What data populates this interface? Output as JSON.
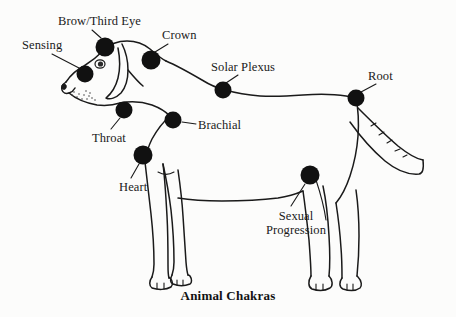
{
  "figure": {
    "title": "Animal Chakras",
    "background_color": "#fcfcfb",
    "ink_color": "#1a1a1a",
    "dot_color": "#111111",
    "width": 456,
    "height": 317
  },
  "chakras": [
    {
      "id": "brow-third-eye",
      "label": "Brow/Third Eye",
      "dot": {
        "cx": 105,
        "cy": 47,
        "r": 9.5
      },
      "label_pos": {
        "x": 58,
        "y": 14
      },
      "leader": {
        "x1": 101,
        "y1": 37,
        "x2": 92,
        "y2": 30
      }
    },
    {
      "id": "sensing",
      "label": "Sensing",
      "dot": {
        "cx": 85,
        "cy": 74,
        "r": 8.5
      },
      "label_pos": {
        "x": 22,
        "y": 38
      },
      "leader": {
        "x1": 78,
        "y1": 68,
        "x2": 50,
        "y2": 53
      }
    },
    {
      "id": "crown",
      "label": "Crown",
      "dot": {
        "cx": 151,
        "cy": 60,
        "r": 9.5
      },
      "label_pos": {
        "x": 162,
        "y": 28
      },
      "leader": {
        "x1": 155,
        "y1": 51,
        "x2": 168,
        "y2": 43
      }
    },
    {
      "id": "solar-plexus",
      "label": "Solar Plexus",
      "dot": {
        "cx": 223,
        "cy": 90,
        "r": 8.5
      },
      "label_pos": {
        "x": 211,
        "y": 60
      },
      "leader": {
        "x1": 226,
        "y1": 82,
        "x2": 237,
        "y2": 74
      }
    },
    {
      "id": "root",
      "label": "Root",
      "dot": {
        "cx": 356,
        "cy": 98,
        "r": 8.5
      },
      "label_pos": {
        "x": 368,
        "y": 69
      },
      "leader": {
        "x1": 361,
        "y1": 91,
        "x2": 376,
        "y2": 83
      }
    },
    {
      "id": "throat",
      "label": "Throat",
      "dot": {
        "cx": 124,
        "cy": 110,
        "r": 8.5
      },
      "label_pos": {
        "x": 92,
        "y": 131
      },
      "leader": {
        "x1": 120,
        "y1": 118,
        "x2": 111,
        "y2": 128
      }
    },
    {
      "id": "brachial",
      "label": "Brachial",
      "dot": {
        "cx": 173,
        "cy": 120,
        "r": 8.5
      },
      "label_pos": {
        "x": 198,
        "y": 118
      },
      "leader": {
        "x1": 182,
        "y1": 122,
        "x2": 196,
        "y2": 124
      }
    },
    {
      "id": "heart",
      "label": "Heart",
      "dot": {
        "cx": 143,
        "cy": 155,
        "r": 9.5
      },
      "label_pos": {
        "x": 119,
        "y": 180
      },
      "leader": {
        "x1": 139,
        "y1": 164,
        "x2": 132,
        "y2": 177
      }
    },
    {
      "id": "sexual-progression",
      "label_line1": "Sexual",
      "label_line2": "Progression",
      "label": "Sexual Progression",
      "dot": {
        "cx": 310,
        "cy": 175,
        "r": 9.5
      },
      "label_pos": {
        "x": 258,
        "y": 209
      },
      "leader": {
        "x1": 305,
        "y1": 184,
        "x2": 292,
        "y2": 204
      }
    }
  ]
}
